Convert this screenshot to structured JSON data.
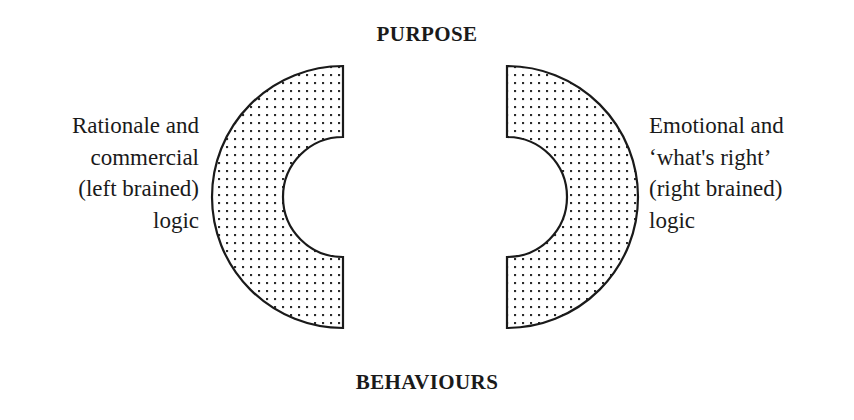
{
  "figure": {
    "type": "two-opposing-arcs-diagram",
    "background_color": "#ffffff",
    "stroke_color": "#1a1a1a",
    "fill_pattern": "dotted",
    "fill_dot_color": "#2b2b2b",
    "fill_dot_spacing_px": 8,
    "fill_dot_size_px": 2
  },
  "labels": {
    "top": "PURPOSE",
    "bottom": "BEHAVIOURS"
  },
  "left_text": {
    "lines": [
      "Rationale and",
      "commercial",
      "(left brained)",
      "logic"
    ],
    "full": "Rationale and\ncommercial\n(left brained)\nlogic",
    "align": "right"
  },
  "right_text": {
    "lines": [
      "Emotional and",
      "‘what's right’",
      "(right brained)",
      "logic"
    ],
    "full": "Emotional and\n‘what's right’\n(right brained)\nlogic",
    "align": "left"
  },
  "shapes": {
    "left_arc": {
      "name": "left-c-arc",
      "description": "C-shaped annulus sector opening to the right",
      "center_x": 343,
      "center_y": 197,
      "outer_radius": 131,
      "inner_radius": 60,
      "start_angle_deg": 90,
      "end_angle_deg": 270
    },
    "right_arc": {
      "name": "right-c-arc",
      "description": "Mirrored C-shaped annulus sector opening to the left",
      "center_x": 507,
      "center_y": 197,
      "outer_radius": 131,
      "inner_radius": 60,
      "start_angle_deg": -90,
      "end_angle_deg": 90
    }
  }
}
